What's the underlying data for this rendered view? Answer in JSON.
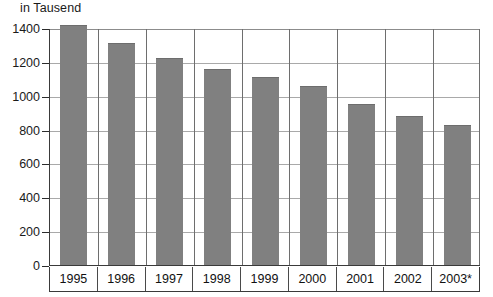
{
  "chart_data": {
    "type": "bar",
    "title": "in Tausend",
    "xlabel": "",
    "ylabel": "",
    "categories": [
      "1995",
      "1996",
      "1997",
      "1998",
      "1999",
      "2000",
      "2001",
      "2002",
      "2003*"
    ],
    "values": [
      1415,
      1310,
      1225,
      1160,
      1110,
      1055,
      950,
      880,
      828
    ],
    "ylim": [
      0,
      1400
    ],
    "yticks": [
      "0",
      "200",
      "400",
      "600",
      "800",
      "1000",
      "1200",
      "1400"
    ],
    "ytick_values": [
      0,
      200,
      400,
      600,
      800,
      1000,
      1200,
      1400
    ],
    "grid": "horizontal-and-vertical",
    "legend": "none",
    "bar_color": "#808080",
    "axis_color": "#3a3a3a",
    "gridline_color": "#a9a9a9",
    "background_color": "#ffffff",
    "footnote_marker": "*"
  }
}
